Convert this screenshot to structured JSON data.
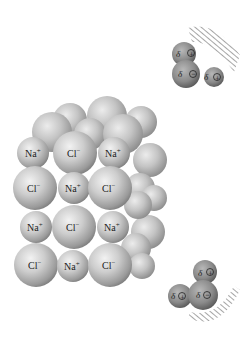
{
  "diagram": {
    "lattice": {
      "rows": [
        [
          "Na+",
          "Cl-",
          "Na+"
        ],
        [
          "Cl-",
          "Na+",
          "Cl-"
        ],
        [
          "Na+",
          "Cl-",
          "Na+"
        ],
        [
          "Cl-",
          "Na+",
          "Cl-"
        ]
      ],
      "labels": {
        "r0c0": "Na",
        "r0c0s": "+",
        "r0c1": "Cl",
        "r0c1s": "−",
        "r0c2": "Na",
        "r0c2s": "+",
        "r1c0": "Cl",
        "r1c0s": "−",
        "r1c1": "Na",
        "r1c1s": "+",
        "r1c2": "Cl",
        "r1c2s": "−",
        "r2c0": "Na",
        "r2c0s": "+",
        "r2c1": "Cl",
        "r2c1s": "−",
        "r2c2": "Na",
        "r2c2s": "+",
        "r3c0": "Cl",
        "r3c0s": "−",
        "r3c1": "Na",
        "r3c1s": "+",
        "r3c2": "Cl",
        "r3c2s": "−"
      }
    },
    "water_top": {
      "h1": {
        "delta": "δ",
        "charge": "+"
      },
      "o": {
        "delta": "δ",
        "charge": "−"
      },
      "h2": {
        "delta": "δ",
        "charge": "+"
      }
    },
    "water_bottom": {
      "h1": {
        "delta": "δ",
        "charge": "+"
      },
      "h2": {
        "delta": "δ",
        "charge": "+"
      },
      "o": {
        "delta": "δ",
        "charge": "−"
      }
    },
    "colors": {
      "sphere_light": "#e4e4e4",
      "sphere_mid": "#b4b4b4",
      "sphere_dark": "#7a7a7a",
      "water_light": "#a8a8a8",
      "water_dark": "#5e5e5e",
      "hatch": "#6a6a6a"
    }
  }
}
